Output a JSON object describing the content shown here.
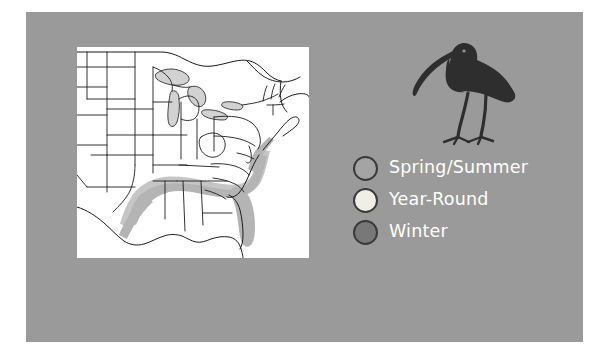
{
  "figure": {
    "kind": "bird-range-map-figure",
    "panel_color": "#9a9a9a",
    "map_background": "#ffffff"
  },
  "bird": {
    "name": "white-faced-ibis-silhouette",
    "color": "#2e2e2e"
  },
  "map": {
    "name": "united-states-range-map",
    "region": "Eastern and Central United States",
    "lake_color": "#d2d2d2",
    "border_color": "#1b1b1b",
    "shaded_range_color": "#b4b4b4",
    "shaded_range_soft_color": "#c6c6c6"
  },
  "legend": {
    "items": [
      {
        "label": "Spring/Summer",
        "swatch_color": "#a4a4a4",
        "swatch_border": "#3a3a3a",
        "name": "legend-swatch-spring-summer"
      },
      {
        "label": "Year-Round",
        "swatch_color": "#efefe7",
        "swatch_border": "#3a3a3a",
        "name": "legend-swatch-year-round"
      },
      {
        "label": "Winter",
        "swatch_color": "#787878",
        "swatch_border": "#3a3a3a",
        "name": "legend-swatch-winter"
      }
    ],
    "text_color": "#ffffff"
  }
}
